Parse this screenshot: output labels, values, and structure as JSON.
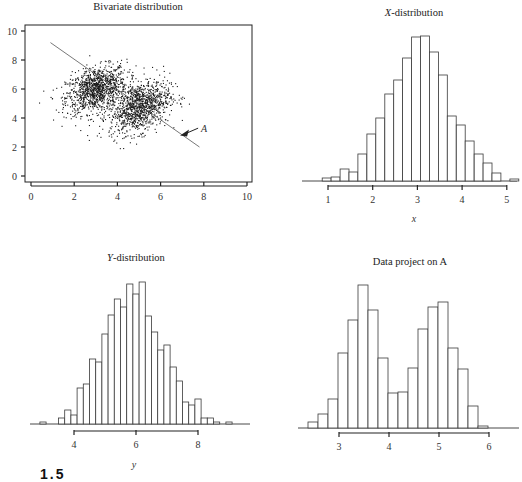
{
  "figure": {
    "caption_fragment": "1.5"
  },
  "chart_data": [
    {
      "id": "bivariate",
      "type": "scatter",
      "title": "Bivariate distribution",
      "xlabel": "",
      "ylabel": "",
      "xlim": [
        0,
        10
      ],
      "ylim": [
        0,
        10
      ],
      "xticks": [
        0,
        2,
        4,
        6,
        8,
        10
      ],
      "yticks": [
        0,
        2,
        4,
        6,
        8,
        10
      ],
      "grid": false,
      "clusters": [
        {
          "name": "cluster-1",
          "center": [
            3.0,
            6.0
          ],
          "sd": [
            0.7,
            0.8
          ],
          "corr": 0.35,
          "n": 1100
        },
        {
          "name": "cluster-2",
          "center": [
            5.0,
            4.8
          ],
          "sd": [
            0.7,
            0.9
          ],
          "corr": 0.35,
          "n": 1100
        }
      ],
      "projection_line": {
        "label": "A",
        "from": [
          0.9,
          9.2
        ],
        "to": [
          7.8,
          2.0
        ]
      },
      "annotation": {
        "text": "A",
        "arrow_to": [
          6.9,
          2.8
        ],
        "text_at": [
          8.2,
          3.3
        ]
      }
    },
    {
      "id": "x-distribution",
      "type": "bar",
      "title": "X-distribution",
      "title_italic_part": "X",
      "title_rest": "-distribution",
      "xlabel": "x",
      "xlim": [
        0.3,
        5.3
      ],
      "xticks": [
        1,
        2,
        3,
        4,
        5
      ],
      "bin_start": 0.87,
      "bin_width": 0.2,
      "values": [
        3,
        4,
        12,
        9,
        27,
        47,
        63,
        87,
        101,
        123,
        144,
        145,
        129,
        106,
        65,
        56,
        40,
        27,
        18,
        8,
        0,
        2
      ]
    },
    {
      "id": "y-distribution",
      "type": "bar",
      "title": "Y-distribution",
      "title_italic_part": "Y",
      "title_rest": "-distribution",
      "xlabel": "y",
      "xlim": [
        2.5,
        9.8
      ],
      "xticks": [
        4,
        6,
        8
      ],
      "bin_start": 2.5,
      "bin_width": 0.2,
      "values": [
        0,
        0,
        2,
        0.5,
        0.5,
        6,
        14,
        9,
        36,
        40,
        65,
        62,
        90,
        109,
        125,
        117,
        140,
        130,
        142,
        108,
        92,
        74,
        79,
        57,
        43,
        22,
        19,
        25,
        6,
        6,
        2,
        0,
        2,
        0
      ]
    },
    {
      "id": "projection-on-A",
      "type": "bar",
      "title": "Data project on A",
      "xlabel": "",
      "xlim": [
        2.2,
        6.6
      ],
      "xticks": [
        3,
        4,
        5,
        6
      ],
      "bin_start": 2.38,
      "bin_width": 0.2,
      "values": [
        6,
        14,
        29,
        75,
        108,
        143,
        118,
        70,
        35,
        36,
        60,
        99,
        121,
        126,
        80,
        59,
        22,
        2
      ]
    }
  ]
}
